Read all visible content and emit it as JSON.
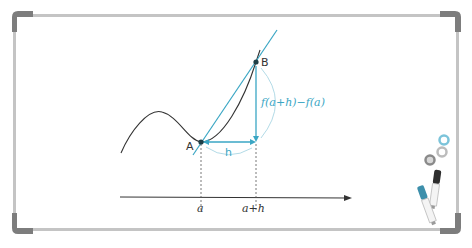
{
  "diagram": {
    "points": {
      "A": {
        "label": "A",
        "x": 201,
        "y": 142
      },
      "B": {
        "label": "B",
        "x": 256,
        "y": 62
      }
    },
    "labels": {
      "h": "h",
      "rise": "f(a+h)−f(a)",
      "x_tick_a": "a",
      "x_tick_a_plus_h": "a+h"
    },
    "colors": {
      "accent": "#3aa6c4",
      "curve": "#333333",
      "frame": "#bdbdbd",
      "frame_corner": "#7a7a7a",
      "axis": "#333333"
    },
    "accessories": {
      "magnets": [
        "light-blue magnet",
        "grey magnet",
        "dark grey magnet"
      ],
      "markers": [
        "blue marker",
        "black marker"
      ]
    }
  }
}
